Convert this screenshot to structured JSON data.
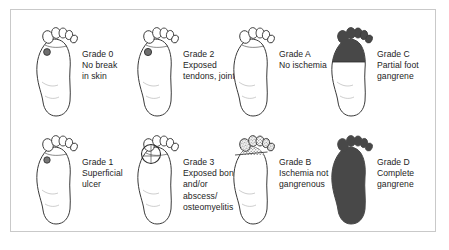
{
  "figure": {
    "border_color": "#c9c9c9",
    "background_color": "#ffffff",
    "ink_color": "#3a3a3a",
    "gangrene_color": "#484848"
  },
  "panels": [
    {
      "id": "grade-0",
      "grade_label": "Grade 0",
      "description_lines": [
        "No break",
        "in skin"
      ],
      "marker": "small-dark-circle",
      "marker_note": "small shaded circular spot on ball of foot",
      "fill": "none"
    },
    {
      "id": "grade-2",
      "grade_label": "Grade 2",
      "description_lines": [
        "Exposed",
        "tendons, joint"
      ],
      "marker": "small-dark-circle",
      "marker_note": "small shaded circular spot on ball of foot",
      "fill": "none"
    },
    {
      "id": "grade-a",
      "grade_label": "Grade A",
      "description_lines": [
        "No ischemia"
      ],
      "marker": "none",
      "marker_note": "plain unmarked foot outline",
      "fill": "none"
    },
    {
      "id": "grade-c",
      "grade_label": "Grade C",
      "description_lines": [
        "Partial foot",
        "gangrene"
      ],
      "marker": "none",
      "marker_note": "forefoot filled dark with horizontal demarcation line",
      "fill": "forefoot-dark"
    },
    {
      "id": "grade-1",
      "grade_label": "Grade 1",
      "description_lines": [
        "Superficial",
        "ulcer"
      ],
      "marker": "small-dark-circle",
      "marker_note": "small shaded circular ulcer on ball of foot",
      "fill": "none"
    },
    {
      "id": "grade-3",
      "grade_label": "Grade 3",
      "description_lines": [
        "Exposed bone",
        "and/or",
        "abscess/",
        "osteomyelitis"
      ],
      "marker": "large-open-circle",
      "marker_note": "large open circle outline over first metatarsal head",
      "fill": "none"
    },
    {
      "id": "grade-b",
      "grade_label": "Grade B",
      "description_lines": [
        "Ischemia not",
        "gangrenous"
      ],
      "marker": "none",
      "marker_note": "toes rendered with stippled hatched texture",
      "fill": "toes-stippled"
    },
    {
      "id": "grade-d",
      "grade_label": "Grade D",
      "description_lines": [
        "Complete",
        "gangrene"
      ],
      "marker": "none",
      "marker_note": "entire foot silhouette filled dark",
      "fill": "whole-foot-dark"
    }
  ]
}
